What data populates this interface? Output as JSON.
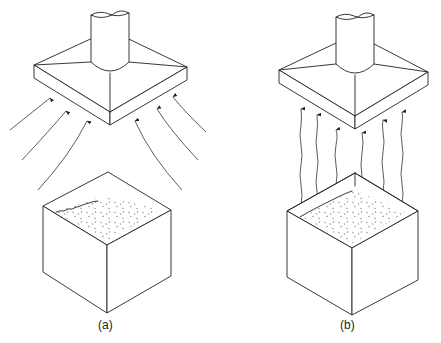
{
  "figure": {
    "panels": [
      {
        "id": "a",
        "label": "(a)",
        "label_letter": "a",
        "description": "Canopy exhaust hood above open tank; air drawn in from surroundings along curved streamlines (cross-draft entrainment)",
        "components": [
          "exhaust-duct",
          "canopy-hood",
          "curved-airflow-arrows",
          "open-tank",
          "liquid-surface"
        ],
        "arrow_count": 6,
        "arrow_style": "curved inward"
      },
      {
        "id": "b",
        "label": "(b)",
        "label_letter": "b",
        "description": "Canopy exhaust hood above open tank; contaminants rise vertically from liquid surface into hood",
        "components": [
          "exhaust-duct",
          "canopy-hood",
          "vertical-rising-arrows",
          "open-tank",
          "liquid-surface"
        ],
        "arrow_count": 6,
        "arrow_style": "vertical wavy upward"
      }
    ],
    "colors": {
      "line": "#222222",
      "background": "#ffffff",
      "surface_speckle": "#777777"
    }
  }
}
